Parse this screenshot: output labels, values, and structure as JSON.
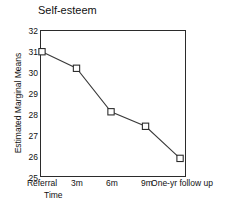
{
  "chart_data": {
    "type": "line",
    "title": "Self-esteem",
    "xlabel": "Time",
    "ylabel": "Estimated Marginal Means",
    "categories": [
      "Referral",
      "3m",
      "6m",
      "9m",
      "One-yr follow up"
    ],
    "values": [
      31.0,
      30.2,
      28.1,
      27.4,
      25.85
    ],
    "series": [
      {
        "name": "Self-esteem",
        "values": [
          31.0,
          30.2,
          28.1,
          27.4,
          25.85
        ]
      }
    ],
    "ylim": [
      25,
      32
    ],
    "yticks": [
      "25",
      "26",
      "27",
      "28",
      "29",
      "30",
      "31",
      "32"
    ],
    "ytick_values": [
      25,
      26,
      27,
      28,
      29,
      30,
      31,
      32
    ],
    "grid": false,
    "legend": "none",
    "marker": "open-square",
    "line_color": "#3a3a3a",
    "marker_fill": "#ffffff",
    "marker_edge": "#2b2b2b"
  }
}
